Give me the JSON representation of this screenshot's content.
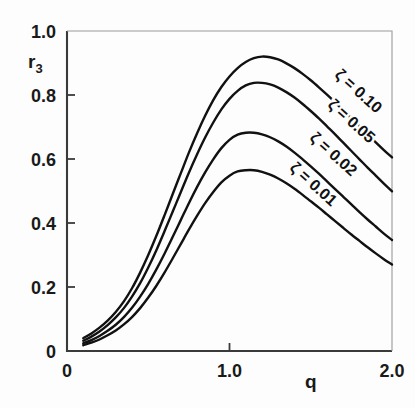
{
  "chart_data": {
    "type": "line",
    "title": "",
    "subtitle": "",
    "xlabel": "q",
    "ylabel": "r3",
    "ylabel_display": "r",
    "ylabel_subscript": "3",
    "xlim": [
      0,
      2.0
    ],
    "ylim": [
      0,
      1.0
    ],
    "grid": false,
    "legend_position": "inline-curve-labels",
    "x_ticks": [
      {
        "value": 0,
        "label": "0"
      },
      {
        "value": 1.0,
        "label": "1.0"
      },
      {
        "value": 2.0,
        "label": "2.0"
      }
    ],
    "y_ticks": [
      {
        "value": 0,
        "label": "0"
      },
      {
        "value": 0.2,
        "label": "0.2"
      },
      {
        "value": 0.4,
        "label": "0.4"
      },
      {
        "value": 0.6,
        "label": "0.6"
      },
      {
        "value": 0.8,
        "label": "0.8"
      },
      {
        "value": 1.0,
        "label": "1.0"
      }
    ],
    "line_color": "#111111",
    "axis_color": "#3a3a3a",
    "series": [
      {
        "name": "zeta = 0.10",
        "label": "ζ = 0.10",
        "peak_x": 1.18,
        "peak_y": 0.92,
        "x": [
          0.1,
          0.15,
          0.2,
          0.25,
          0.3,
          0.35,
          0.4,
          0.45,
          0.5,
          0.55,
          0.6,
          0.65,
          0.7,
          0.75,
          0.8,
          0.85,
          0.9,
          0.95,
          1.0,
          1.05,
          1.1,
          1.15,
          1.2,
          1.25,
          1.3,
          1.35,
          1.4,
          1.45,
          1.5,
          1.55,
          1.6,
          1.65,
          1.7,
          1.75,
          1.8,
          1.85,
          1.9,
          1.95,
          2.0
        ],
        "y": [
          0.04,
          0.055,
          0.073,
          0.095,
          0.122,
          0.155,
          0.196,
          0.245,
          0.3,
          0.36,
          0.424,
          0.49,
          0.555,
          0.62,
          0.68,
          0.735,
          0.784,
          0.825,
          0.858,
          0.884,
          0.903,
          0.915,
          0.92,
          0.918,
          0.911,
          0.899,
          0.884,
          0.866,
          0.846,
          0.824,
          0.801,
          0.777,
          0.752,
          0.727,
          0.702,
          0.677,
          0.652,
          0.628,
          0.605
        ]
      },
      {
        "name": "zeta = 0.05",
        "label": "ζ = 0.05",
        "peak_x": 1.16,
        "peak_y": 0.838,
        "x": [
          0.1,
          0.15,
          0.2,
          0.25,
          0.3,
          0.35,
          0.4,
          0.45,
          0.5,
          0.55,
          0.6,
          0.65,
          0.7,
          0.75,
          0.8,
          0.85,
          0.9,
          0.95,
          1.0,
          1.05,
          1.1,
          1.15,
          1.2,
          1.25,
          1.3,
          1.35,
          1.4,
          1.45,
          1.5,
          1.55,
          1.6,
          1.65,
          1.7,
          1.75,
          1.8,
          1.85,
          1.9,
          1.95,
          2.0
        ],
        "y": [
          0.032,
          0.045,
          0.061,
          0.081,
          0.105,
          0.134,
          0.17,
          0.212,
          0.261,
          0.315,
          0.374,
          0.435,
          0.496,
          0.557,
          0.614,
          0.667,
          0.714,
          0.755,
          0.788,
          0.813,
          0.83,
          0.838,
          0.838,
          0.833,
          0.823,
          0.809,
          0.792,
          0.772,
          0.75,
          0.727,
          0.702,
          0.677,
          0.651,
          0.625,
          0.599,
          0.573,
          0.548,
          0.523,
          0.499
        ]
      },
      {
        "name": "zeta = 0.02",
        "label": "ζ = 0.02",
        "peak_x": 1.14,
        "peak_y": 0.682,
        "x": [
          0.1,
          0.15,
          0.2,
          0.25,
          0.3,
          0.35,
          0.4,
          0.45,
          0.5,
          0.55,
          0.6,
          0.65,
          0.7,
          0.75,
          0.8,
          0.85,
          0.9,
          0.95,
          1.0,
          1.05,
          1.1,
          1.15,
          1.2,
          1.25,
          1.3,
          1.35,
          1.4,
          1.45,
          1.5,
          1.55,
          1.6,
          1.65,
          1.7,
          1.75,
          1.8,
          1.85,
          1.9,
          1.95,
          2.0
        ],
        "y": [
          0.024,
          0.034,
          0.047,
          0.063,
          0.082,
          0.106,
          0.135,
          0.17,
          0.21,
          0.255,
          0.304,
          0.356,
          0.409,
          0.462,
          0.512,
          0.558,
          0.599,
          0.634,
          0.66,
          0.676,
          0.682,
          0.682,
          0.677,
          0.668,
          0.655,
          0.639,
          0.62,
          0.599,
          0.577,
          0.554,
          0.53,
          0.506,
          0.482,
          0.458,
          0.434,
          0.411,
          0.389,
          0.367,
          0.347
        ]
      },
      {
        "name": "zeta = 0.01",
        "label": "ζ = 0.01",
        "peak_x": 1.13,
        "peak_y": 0.565,
        "x": [
          0.1,
          0.15,
          0.2,
          0.25,
          0.3,
          0.35,
          0.4,
          0.45,
          0.5,
          0.55,
          0.6,
          0.65,
          0.7,
          0.75,
          0.8,
          0.85,
          0.9,
          0.95,
          1.0,
          1.05,
          1.1,
          1.15,
          1.2,
          1.25,
          1.3,
          1.35,
          1.4,
          1.45,
          1.5,
          1.55,
          1.6,
          1.65,
          1.7,
          1.75,
          1.8,
          1.85,
          1.9,
          1.95,
          2.0
        ],
        "y": [
          0.018,
          0.026,
          0.036,
          0.049,
          0.064,
          0.083,
          0.106,
          0.134,
          0.167,
          0.204,
          0.245,
          0.289,
          0.334,
          0.379,
          0.422,
          0.462,
          0.497,
          0.527,
          0.548,
          0.561,
          0.565,
          0.565,
          0.56,
          0.551,
          0.539,
          0.524,
          0.507,
          0.488,
          0.468,
          0.448,
          0.427,
          0.406,
          0.385,
          0.364,
          0.344,
          0.324,
          0.305,
          0.287,
          0.27
        ]
      }
    ],
    "curve_labels": [
      {
        "text": "ζ = 0.10",
        "x_px": 355,
        "y_px": 95,
        "rotation": 42
      },
      {
        "text": "ζ = 0.05",
        "x_px": 348,
        "y_px": 125,
        "rotation": 42
      },
      {
        "text": "ζ = 0.02",
        "x_px": 330,
        "y_px": 158,
        "rotation": 42
      },
      {
        "text": "ζ = 0.01",
        "x_px": 310,
        "y_px": 188,
        "rotation": 42
      }
    ]
  }
}
